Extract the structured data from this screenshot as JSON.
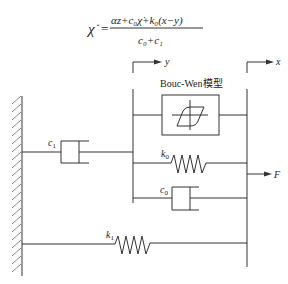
{
  "formula": {
    "lhs": "χ̇",
    "equals": "=",
    "numerator": "αz+c₀χ̇+k₀(x−y)",
    "denominator": "c₀+c₁"
  },
  "labels": {
    "bouc_wen": "Bouc-Wen模型",
    "y_disp": "y",
    "x_disp": "x",
    "force": "F",
    "c1": "c",
    "c1_sub": "1",
    "k0": "k",
    "k0_sub": "0",
    "c0": "c",
    "c0_sub": "0",
    "k1": "k",
    "k1_sub": "1"
  },
  "colors": {
    "line": "#333333",
    "background": "#ffffff"
  }
}
